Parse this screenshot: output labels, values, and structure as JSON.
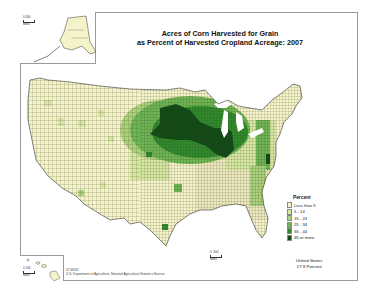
{
  "map": {
    "title_line1": "Acres of Corn Harvested for Grain",
    "title_line2": "as Percent of Harvested Cropland Acreage:  2007",
    "legend": {
      "title": "Percent",
      "items": [
        {
          "label": "Less than 5",
          "color": "#f4f3c9"
        },
        {
          "label": "5 - 14",
          "color": "#d6e6a3"
        },
        {
          "label": "15 - 24",
          "color": "#a9d07a"
        },
        {
          "label": "25 - 34",
          "color": "#6db453"
        },
        {
          "label": "35 - 44",
          "color": "#2f8a2e"
        },
        {
          "label": "45 or more",
          "color": "#0f4a17"
        }
      ]
    },
    "summary": {
      "line1": "United States",
      "line2": "27.9 Percent"
    },
    "scales": {
      "alaska": {
        "zero": "0",
        "max": "300",
        "unit": "Miles"
      },
      "hawaii": {
        "zero": "0",
        "max": "100",
        "unit": "Miles"
      },
      "conus": {
        "zero": "0",
        "max": "300",
        "unit": "Miles"
      }
    },
    "footnote": {
      "code": "07-M162",
      "source": "U.S. Department of Agriculture, National Agricultural Statistics Service"
    },
    "colors": {
      "background": "#ffffff",
      "border": "#9a9a9a",
      "county_lines": "#3a3a1a",
      "water": "#ffffff"
    }
  }
}
